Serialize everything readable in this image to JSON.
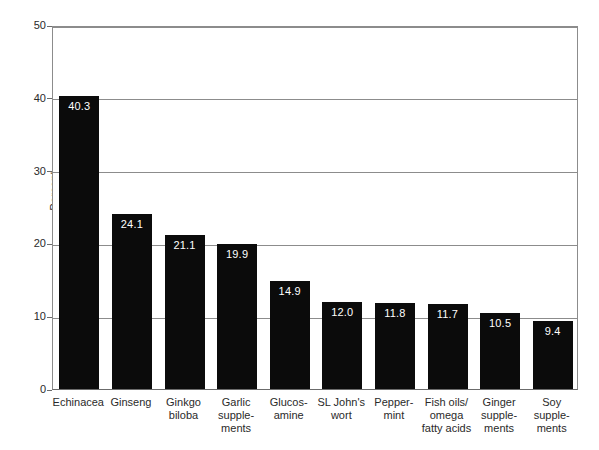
{
  "chart_data": {
    "type": "bar",
    "title": "",
    "subtitle": "",
    "xlabel": "",
    "ylabel": "Percent",
    "ylim": [
      0,
      50
    ],
    "yticks": [
      0,
      10,
      20,
      30,
      40,
      50
    ],
    "ytick_labels": [
      "0",
      "10",
      "20",
      "30",
      "40",
      "50"
    ],
    "grid": true,
    "legend": false,
    "orientation": "vertical",
    "bar_color": "#0b0b0b",
    "label_color": "#ffffff",
    "gridline_color": "#8c8c8c",
    "background_color": "#ffffff",
    "categories": [
      "Echinacea",
      "Ginseng",
      "Ginkgo biloba",
      "Garlic supplements",
      "Glucosamine",
      "SL John's wort",
      "Peppermint",
      "Fish oils/omega fatty acids",
      "Ginger supplements",
      "Soy supplements"
    ],
    "category_labels_wrapped": [
      "Echinacea",
      "Ginseng",
      "Ginkgo\nbiloba",
      "Garlic\nsupple-\nments",
      "Glucos-\namine",
      "SL John's\nwort",
      "Pepper-\nmint",
      "Fish oils/\nomega\nfatty acids",
      "Ginger\nsupple-\nments",
      "Soy\nsupple-\nments"
    ],
    "values": [
      40.3,
      24.1,
      21.1,
      19.9,
      14.9,
      12.0,
      11.8,
      11.7,
      10.5,
      9.4
    ],
    "value_labels": [
      "40.3",
      "24.1",
      "21.1",
      "19.9",
      "14.9",
      "12.0",
      "11.8",
      "11.7",
      "10.5",
      "9.4"
    ]
  }
}
